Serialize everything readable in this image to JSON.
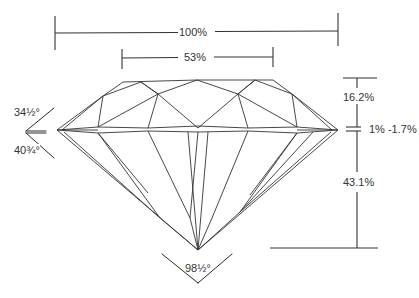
{
  "diagram": {
    "title_partial": "",
    "colors": {
      "line": "#2b2b2b",
      "text": "#333333",
      "background": "#ffffff"
    },
    "labels": {
      "total_width": "100%",
      "table_width": "53%",
      "crown_height": "16.2%",
      "girdle_thickness": "1% -1.7%",
      "pavilion_depth": "43.1%",
      "crown_angle": "34½°",
      "pavilion_angle": "40¾°",
      "culet_angle": "98½°"
    }
  }
}
